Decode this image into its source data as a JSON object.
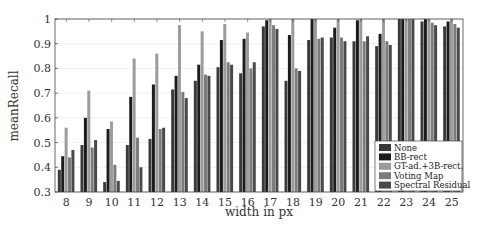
{
  "chart_data": {
    "type": "bar",
    "title": "",
    "xlabel": "width in px",
    "ylabel": "meanRecall",
    "ylim": [
      0.3,
      1.0
    ],
    "yticks": [
      "0.3",
      "0.4",
      "0.5",
      "0.6",
      "0.7",
      "0.8",
      "0.9",
      "1"
    ],
    "grid": true,
    "legend_position": "lower right",
    "categories": [
      "8",
      "9",
      "10",
      "11",
      "12",
      "13",
      "14",
      "15",
      "16",
      "17",
      "18",
      "19",
      "20",
      "21",
      "22",
      "23",
      "24",
      "25"
    ],
    "series": [
      {
        "name": "None",
        "color": "#3a3a3a",
        "values": [
          0.39,
          0.49,
          0.34,
          0.49,
          0.515,
          0.715,
          0.75,
          0.805,
          0.78,
          0.97,
          0.75,
          0.915,
          0.925,
          0.91,
          0.89,
          1.0,
          0.99,
          0.97
        ]
      },
      {
        "name": "BB-rect",
        "color": "#1c1c1c",
        "values": [
          0.445,
          0.6,
          0.555,
          0.685,
          0.735,
          0.77,
          0.815,
          0.915,
          0.92,
          0.995,
          0.935,
          1.0,
          0.965,
          0.995,
          0.94,
          1.0,
          1.0,
          0.99
        ]
      },
      {
        "name": "GT-ad.+3B-rect.",
        "color": "#9c9c9c",
        "values": [
          0.56,
          0.71,
          0.585,
          0.84,
          0.86,
          0.975,
          0.95,
          0.98,
          0.945,
          1.0,
          1.0,
          1.0,
          1.0,
          1.0,
          1.0,
          1.0,
          1.0,
          1.0
        ]
      },
      {
        "name": "Voting Map",
        "color": "#7c7c7c",
        "values": [
          0.44,
          0.48,
          0.41,
          0.52,
          0.555,
          0.705,
          0.775,
          0.825,
          0.8,
          0.975,
          0.8,
          0.92,
          0.925,
          0.91,
          0.91,
          1.0,
          0.985,
          0.98
        ]
      },
      {
        "name": "Spectral Residual",
        "color": "#4a4a4a",
        "values": [
          0.47,
          0.51,
          0.345,
          0.4,
          0.56,
          0.68,
          0.77,
          0.815,
          0.825,
          0.96,
          0.79,
          0.925,
          0.91,
          0.93,
          0.895,
          1.0,
          0.975,
          0.965
        ]
      }
    ]
  },
  "legend": {
    "items": [
      "None",
      "BB-rect",
      "GT-ad.+3B-rect.",
      "Voting Map",
      "Spectral Residual"
    ]
  },
  "axes": {
    "xlabel": "width in px",
    "ylabel": "meanRecall"
  }
}
